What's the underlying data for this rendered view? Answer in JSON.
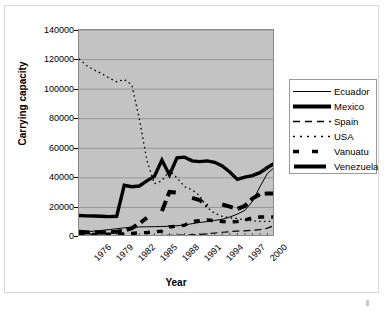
{
  "chart": {
    "xtitle": "Year",
    "ytitle": "Carrying capacity",
    "background": "#c3c3c3",
    "gridline_color": "#8a8a8a",
    "legend_border": "#9a9a9a"
  },
  "yaxis": {
    "ticks": [
      "0",
      "20000",
      "40000",
      "60000",
      "80000",
      "100000",
      "120000",
      "140000"
    ]
  },
  "xaxis": {
    "ticks": [
      "1976",
      "1979",
      "1982",
      "1985",
      "1988",
      "1991",
      "1994",
      "1997",
      "2000"
    ]
  },
  "legend": {
    "items": [
      {
        "label": "Ecuador",
        "style": "thin-solid"
      },
      {
        "label": "Mexico",
        "style": "thick-solid"
      },
      {
        "label": "Spain",
        "style": "long-dash"
      },
      {
        "label": "USA",
        "style": "dotted"
      },
      {
        "label": "Vanuatu",
        "style": "thick-dash"
      },
      {
        "label": "Venezuela",
        "style": "thick-solid"
      }
    ]
  },
  "chart_data": {
    "type": "line",
    "title": "",
    "xlabel": "Year",
    "ylabel": "Carrying capacity",
    "xlim": [
      1976,
      2002
    ],
    "ylim": [
      0,
      140000
    ],
    "grid": true,
    "legend_position": "right",
    "x": [
      1976,
      1977,
      1978,
      1979,
      1980,
      1981,
      1982,
      1983,
      1984,
      1985,
      1986,
      1987,
      1988,
      1989,
      1990,
      1991,
      1992,
      1993,
      1994,
      1995,
      1996,
      1997,
      1998,
      1999,
      2000,
      2001,
      2002
    ],
    "series": [
      {
        "name": "Ecuador",
        "style": "thin-solid",
        "values": [
          3000,
          3500,
          4000,
          4500,
          5000,
          5600,
          6200,
          6600,
          6800,
          6900,
          7000,
          7100,
          7300,
          7600,
          8200,
          9000,
          9800,
          10400,
          11200,
          12000,
          13500,
          15500,
          18000,
          24000,
          34000,
          43000,
          47500
        ]
      },
      {
        "name": "Mexico",
        "style": "thick-solid",
        "values": [
          14500,
          14300,
          14200,
          14000,
          13800,
          14000,
          35000,
          34000,
          34500,
          38000,
          41000,
          52000,
          42000,
          53500,
          54000,
          51500,
          51000,
          51500,
          50500,
          48000,
          44000,
          39000,
          40500,
          41500,
          43500,
          47000,
          50000
        ]
      },
      {
        "name": "Spain",
        "style": "long-dash",
        "values": [
          3600,
          2600,
          1400,
          900,
          800,
          800,
          800,
          800,
          800,
          900,
          900,
          1000,
          1100,
          1200,
          1300,
          1500,
          1800,
          2200,
          2700,
          3200,
          3600,
          4000,
          4200,
          4500,
          5000,
          6000,
          8000
        ]
      },
      {
        "name": "USA",
        "style": "dotted",
        "values": [
          120500,
          116000,
          113000,
          110500,
          107500,
          105000,
          106500,
          103000,
          80000,
          52000,
          36000,
          38000,
          45000,
          40000,
          34000,
          32000,
          28000,
          20000,
          16000,
          14000,
          13000,
          12500,
          11500,
          11000,
          10500,
          10500,
          10500
        ]
      },
      {
        "name": "Vanuatu",
        "style": "thick-dash",
        "values": [
          1500,
          1600,
          1700,
          1800,
          1900,
          2000,
          2100,
          2400,
          2800,
          3000,
          3400,
          4000,
          6800,
          7400,
          8000,
          10500,
          11000,
          11500,
          11000,
          10500,
          10000,
          10500,
          11500,
          13000,
          13500,
          13500,
          13500
        ]
      },
      {
        "name": "Venezuela",
        "style": "thick-dash-bold",
        "values": [
          3500,
          3200,
          3000,
          3000,
          3200,
          3600,
          4200,
          6000,
          9000,
          13000,
          null,
          17500,
          30500,
          30000,
          null,
          26500,
          25000,
          21000,
          null,
          22000,
          20500,
          19000,
          21000,
          26000,
          29000,
          29500,
          29500
        ]
      }
    ]
  }
}
